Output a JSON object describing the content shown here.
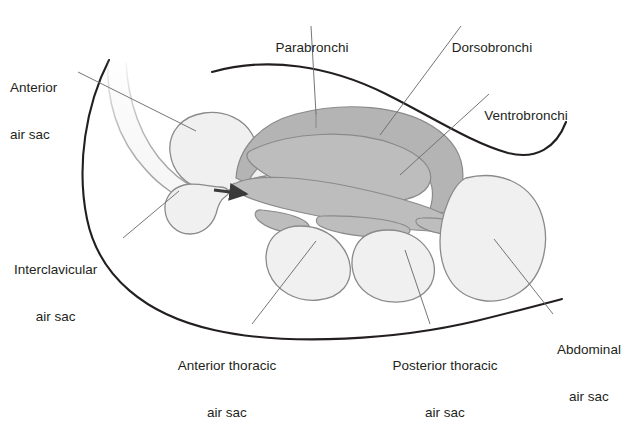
{
  "diagram": {
    "type": "anatomical-diagram",
    "background_color": "#ffffff",
    "palette": {
      "outline_dark": "#231f20",
      "lung_gray": "#b4b4b4",
      "lung_gray_mid": "#bdbdbd",
      "air_sac_fill": "#f0f0f0",
      "organ_stroke": "#8a8a8a",
      "leader_line": "#6e6e6e",
      "text": "#231f20",
      "trachea_fill": "#f7f7f7"
    },
    "labels": [
      {
        "id": "anterior-air-sac",
        "text_lines": [
          "Anterior",
          "air sac"
        ],
        "align": "left",
        "x": 10,
        "y": 49,
        "leader": {
          "x1": 78,
          "y1": 72,
          "x2": 196,
          "y2": 131
        }
      },
      {
        "id": "parabronchi",
        "text_lines": [
          "Parabronchi"
        ],
        "align": "center",
        "x": 264,
        "y": 9,
        "leader": {
          "x1": 311,
          "y1": 26,
          "x2": 316,
          "y2": 114
        }
      },
      {
        "id": "dorsobronchi",
        "text_lines": [
          "Dorsobronchi"
        ],
        "align": "center",
        "x": 440,
        "y": 9,
        "leader": {
          "x1": 461,
          "y1": 26,
          "x2": 380,
          "y2": 135
        }
      },
      {
        "id": "ventrobronchi",
        "text_lines": [
          "Ventrobronchi"
        ],
        "align": "center",
        "x": 473,
        "y": 77,
        "leader": {
          "x1": 489,
          "y1": 94,
          "x2": 400,
          "y2": 175
        }
      },
      {
        "id": "interclavicular-air-sac",
        "text_lines": [
          "Interclavicular",
          "air sac"
        ],
        "align": "left",
        "x": 14,
        "y": 231,
        "leader": {
          "x1": 123,
          "y1": 238,
          "x2": 179,
          "y2": 191
        }
      },
      {
        "id": "anterior-thoracic-air-sac",
        "text_lines": [
          "Anterior thoracic",
          "air sac"
        ],
        "align": "center",
        "x": 163,
        "y": 327,
        "leader": {
          "x1": 252,
          "y1": 324,
          "x2": 316,
          "y2": 241
        }
      },
      {
        "id": "posterior-thoracic-air-sac",
        "text_lines": [
          "Posterior thoracic",
          "air sac"
        ],
        "align": "center",
        "x": 379,
        "y": 327,
        "leader": {
          "x1": 430,
          "y1": 324,
          "x2": 405,
          "y2": 250
        }
      },
      {
        "id": "abdominal-air-sac",
        "text_lines": [
          "Abdominal",
          "air sac"
        ],
        "align": "left",
        "x": 553,
        "y": 311,
        "leader": {
          "x1": 553,
          "y1": 314,
          "x2": 494,
          "y2": 239
        }
      }
    ],
    "structures": [
      {
        "id": "body-outline-upper",
        "kind": "contour"
      },
      {
        "id": "body-outline-lower",
        "kind": "contour"
      },
      {
        "id": "trachea",
        "kind": "airway"
      },
      {
        "id": "anterior-air-sac-shape",
        "kind": "air-sac"
      },
      {
        "id": "interclavicular-air-sac-shape",
        "kind": "air-sac"
      },
      {
        "id": "parabronchi-shape",
        "kind": "lung-region"
      },
      {
        "id": "dorsobronchi-shape",
        "kind": "lung-region"
      },
      {
        "id": "ventrobronchi-shape",
        "kind": "lung-region"
      },
      {
        "id": "anterior-thoracic-air-sac-shape",
        "kind": "air-sac"
      },
      {
        "id": "posterior-thoracic-air-sac-shape",
        "kind": "air-sac"
      },
      {
        "id": "abdominal-air-sac-shape",
        "kind": "air-sac"
      },
      {
        "id": "airflow-arrow",
        "kind": "arrow",
        "direction": "right"
      }
    ]
  }
}
